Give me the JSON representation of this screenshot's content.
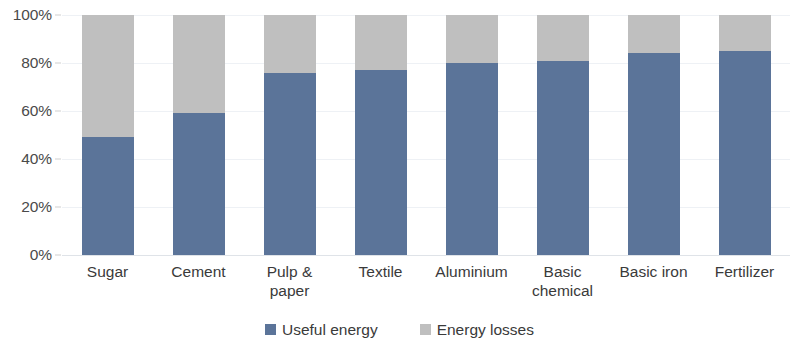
{
  "chart_data": {
    "type": "bar",
    "subtype": "stacked-bar-100-percent",
    "title": "",
    "subtitle": "",
    "xlabel": "",
    "ylabel": "",
    "ylim": [
      0,
      100
    ],
    "y_unit": "%",
    "grid": true,
    "legend_position": "bottom-center",
    "categories": [
      "Sugar",
      "Cement",
      "Pulp & paper",
      "Textile",
      "Aluminium",
      "Basic chemical",
      "Basic iron",
      "Fertilizer"
    ],
    "y_ticks": [
      "0%",
      "20%",
      "40%",
      "60%",
      "80%",
      "100%"
    ],
    "y_tick_values": [
      0,
      20,
      40,
      60,
      80,
      100
    ],
    "series": [
      {
        "name": "Useful energy",
        "color": "#5b7499",
        "values": [
          49,
          59,
          76,
          77,
          80,
          81,
          84,
          85
        ]
      },
      {
        "name": "Energy losses",
        "color": "#bfbfbf",
        "values": [
          51,
          41,
          24,
          23,
          20,
          19,
          16,
          15
        ]
      }
    ]
  },
  "axis": {
    "y_ticks": [
      {
        "label": "100%",
        "value": 100
      },
      {
        "label": "80%",
        "value": 80
      },
      {
        "label": "60%",
        "value": 60
      },
      {
        "label": "40%",
        "value": 40
      },
      {
        "label": "20%",
        "value": 20
      },
      {
        "label": "0%",
        "value": 0
      }
    ]
  },
  "legend": {
    "items": [
      {
        "label": "Useful energy",
        "color": "#5b7499"
      },
      {
        "label": "Energy losses",
        "color": "#bfbfbf"
      }
    ]
  }
}
